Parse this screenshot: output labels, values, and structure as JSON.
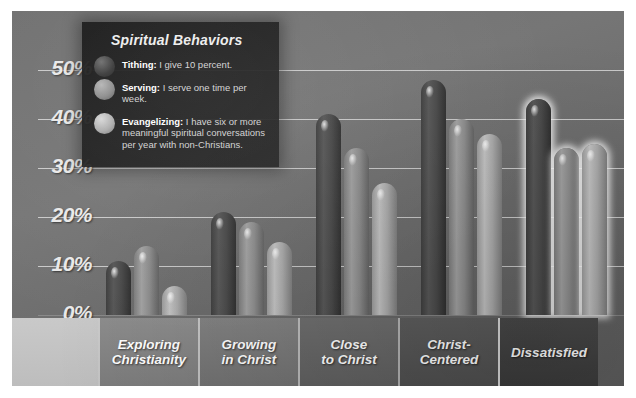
{
  "chart_data": {
    "type": "bar",
    "title": "Spiritual Behaviors",
    "xlabel": "",
    "ylabel": "",
    "ylim": [
      0,
      50
    ],
    "grid": true,
    "legend_position": "top-left-inset",
    "ytick_labels": [
      "50%",
      "40%",
      "30%",
      "20%",
      "10%",
      "0%"
    ],
    "ytick_values": [
      50,
      40,
      30,
      20,
      10,
      0
    ],
    "categories": [
      "Exploring Christianity",
      "Growing in Christ",
      "Close to Christ",
      "Christ-Centered",
      "Dissatisfied"
    ],
    "category_lines": [
      [
        "Exploring",
        "Christianity"
      ],
      [
        "Growing",
        "in Christ"
      ],
      [
        "Close",
        "to Christ"
      ],
      [
        "Christ-",
        "Centered"
      ],
      [
        "Dissatisfied"
      ]
    ],
    "highlighted_category": "Dissatisfied",
    "series": [
      {
        "name": "Tithing",
        "color": "#4a4a4a",
        "values": [
          11,
          21,
          41,
          48,
          44
        ]
      },
      {
        "name": "Serving",
        "color": "#8d8d8d",
        "values": [
          14,
          19,
          34,
          40,
          34
        ]
      },
      {
        "name": "Evangelizing",
        "color": "#ababab",
        "values": [
          6,
          15,
          27,
          37,
          35
        ]
      }
    ]
  },
  "legend": {
    "title": "Spiritual Behaviors",
    "items": [
      {
        "icon": "legend-swatch-tithing",
        "name": "Tithing",
        "desc": "I give 10 percent."
      },
      {
        "icon": "legend-swatch-serving",
        "name": "Serving",
        "desc": "I serve one time per week."
      },
      {
        "icon": "legend-swatch-evangelizing",
        "name": "Evangelizing",
        "desc": "I have six or more meaningful  spiritual conversations per year with non-Christians."
      }
    ]
  },
  "colors": {
    "background": "#ffffff",
    "plot_bg": "#6f6f6f",
    "gridline": "#ececec",
    "tick_text": "#e9e9e9",
    "category_text": "#ffffff",
    "highlight_glow": "#ffffff"
  }
}
